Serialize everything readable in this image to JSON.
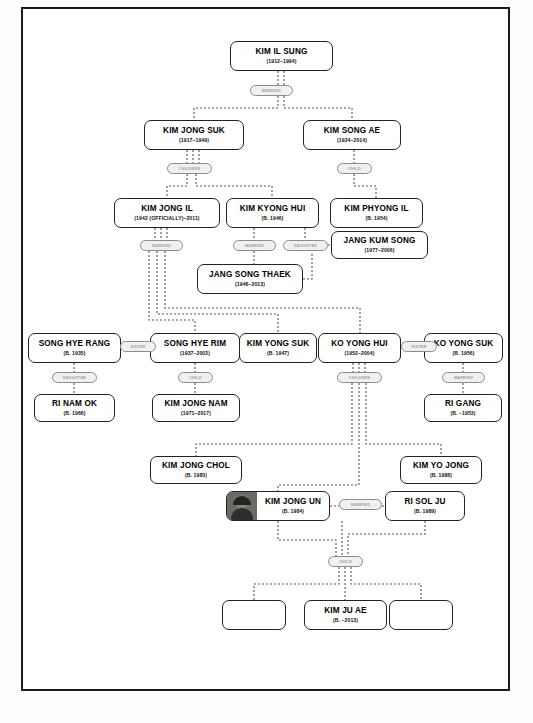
{
  "diagram": {
    "type": "family-tree",
    "nodes": [
      {
        "id": "kim_il_sung",
        "name": "KIM IL SUNG",
        "dates": "(1912–1994)",
        "x": 230,
        "y": 41,
        "w": 103,
        "h": 30
      },
      {
        "id": "kim_jong_suk",
        "name": "KIM JONG SUK",
        "dates": "(1917–1949)",
        "x": 144,
        "y": 120,
        "w": 100,
        "h": 30
      },
      {
        "id": "kim_song_ae",
        "name": "KIM SONG AE",
        "dates": "(1924–2014)",
        "x": 303,
        "y": 120,
        "w": 98,
        "h": 30
      },
      {
        "id": "kim_jong_il",
        "name": "KIM JONG IL",
        "dates": "(1942 (OFFICIALLY)–2011)",
        "x": 114,
        "y": 198,
        "w": 106,
        "h": 30
      },
      {
        "id": "kim_kyong_hui",
        "name": "KIM KYONG HUI",
        "dates": "(B. 1946)",
        "x": 226,
        "y": 198,
        "w": 93,
        "h": 30
      },
      {
        "id": "kim_phyong_il",
        "name": "KIM PHYONG IL",
        "dates": "(B. 1954)",
        "x": 330,
        "y": 198,
        "w": 93,
        "h": 30
      },
      {
        "id": "jang_kum_song",
        "name": "JANG KUM SONG",
        "dates": "(1977–2006)",
        "x": 331,
        "y": 231,
        "w": 97,
        "h": 28
      },
      {
        "id": "jang_song_thaek",
        "name": "JANG SONG THAEK",
        "dates": "(1946–2013)",
        "x": 197,
        "y": 264,
        "w": 106,
        "h": 30
      },
      {
        "id": "song_hye_rang",
        "name": "SONG HYE RANG",
        "dates": "(B. 1935)",
        "x": 28,
        "y": 333,
        "w": 93,
        "h": 30
      },
      {
        "id": "song_hye_rim",
        "name": "SONG HYE RIM",
        "dates": "(1937–2002)",
        "x": 150,
        "y": 333,
        "w": 90,
        "h": 30
      },
      {
        "id": "kim_yong_suk",
        "name": "KIM YONG SUK",
        "dates": "(B. 1947)",
        "x": 239,
        "y": 333,
        "w": 78,
        "h": 30
      },
      {
        "id": "ko_yong_hui",
        "name": "KO YONG HUI",
        "dates": "(1952–2004)",
        "x": 318,
        "y": 333,
        "w": 83,
        "h": 30
      },
      {
        "id": "ko_yong_suk",
        "name": "KO YONG SUK",
        "dates": "(B. 1956)",
        "x": 424,
        "y": 333,
        "w": 79,
        "h": 30
      },
      {
        "id": "ri_nam_ok",
        "name": "RI NAM OK",
        "dates": "(B. 1966)",
        "x": 34,
        "y": 394,
        "w": 81,
        "h": 28
      },
      {
        "id": "kim_jong_nam",
        "name": "KIM JONG NAM",
        "dates": "(1971–2017)",
        "x": 152,
        "y": 394,
        "w": 88,
        "h": 28
      },
      {
        "id": "ri_gang",
        "name": "RI GANG",
        "dates": "(B. ~1953)",
        "x": 424,
        "y": 394,
        "w": 78,
        "h": 28
      },
      {
        "id": "kim_jong_chol",
        "name": "KIM JONG CHOL",
        "dates": "(B. 1980)",
        "x": 150,
        "y": 456,
        "w": 92,
        "h": 28
      },
      {
        "id": "kim_yo_jong",
        "name": "KIM YO JONG",
        "dates": "(B. 1988)",
        "x": 400,
        "y": 456,
        "w": 82,
        "h": 28
      },
      {
        "id": "kim_jong_un",
        "name": "KIM JONG UN",
        "dates": "(B. 1984)",
        "x": 226,
        "y": 491,
        "w": 104,
        "h": 30,
        "photo": "kim-jong-un-portrait"
      },
      {
        "id": "ri_sol_ju",
        "name": "RI SOL JU",
        "dates": "(B. 1989)",
        "x": 385,
        "y": 491,
        "w": 80,
        "h": 30
      },
      {
        "id": "kim_ju_ae",
        "name": "KIM JU AE",
        "dates": "(B. ~2013)",
        "x": 304,
        "y": 600,
        "w": 83,
        "h": 30
      }
    ],
    "empty_nodes": [
      {
        "id": "unnamed_child_left",
        "x": 222,
        "y": 600,
        "w": 64,
        "h": 30
      },
      {
        "id": "unnamed_child_right",
        "x": 389,
        "y": 600,
        "w": 64,
        "h": 30
      }
    ],
    "relation_labels": [
      {
        "id": "rel_kis_marriage",
        "label": "MARRIED",
        "x": 250,
        "y": 85,
        "w": 43
      },
      {
        "id": "rel_kjs_children",
        "label": "CHILDREN",
        "x": 167,
        "y": 163,
        "w": 45
      },
      {
        "id": "rel_ksa_child",
        "label": "CHILD",
        "x": 337,
        "y": 163,
        "w": 35
      },
      {
        "id": "rel_kji_married",
        "label": "MARRIED",
        "x": 140,
        "y": 240,
        "w": 43
      },
      {
        "id": "rel_kkh_married",
        "label": "MARRIED",
        "x": 233,
        "y": 240,
        "w": 43
      },
      {
        "id": "rel_jkh_daughter",
        "label": "DAUGHTER",
        "x": 283,
        "y": 240,
        "w": 45
      },
      {
        "id": "rel_song_sisters",
        "label": "SISTER",
        "x": 120,
        "y": 341,
        "w": 36
      },
      {
        "id": "rel_shr_daughter",
        "label": "DAUGHTER",
        "x": 52,
        "y": 372,
        "w": 45
      },
      {
        "id": "rel_shrim_child",
        "label": "CHILD",
        "x": 178,
        "y": 372,
        "w": 35
      },
      {
        "id": "rel_kyh_children",
        "label": "CHILDREN",
        "x": 337,
        "y": 372,
        "w": 45
      },
      {
        "id": "rel_ko_sisters",
        "label": "SISTER",
        "x": 401,
        "y": 341,
        "w": 36
      },
      {
        "id": "rel_kys_married",
        "label": "MARRIED",
        "x": 442,
        "y": 372,
        "w": 43
      },
      {
        "id": "rel_kju_married",
        "label": "MARRIED",
        "x": 339,
        "y": 499,
        "w": 43
      },
      {
        "id": "rel_kju_child",
        "label": "CHILD",
        "x": 328,
        "y": 556,
        "w": 35
      }
    ],
    "colors": {
      "box_border": "#222222",
      "box_fill": "#ffffff",
      "pill_border": "#8d8d8d",
      "pill_fill": "#f0f0f0",
      "pill_text": "#9a9a9a",
      "connector": "#555555",
      "frame": "#1a1a1a",
      "page_background": "#ffffff"
    }
  }
}
